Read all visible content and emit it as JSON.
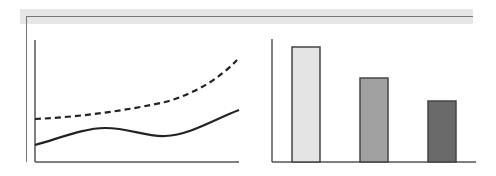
{
  "panel": {
    "frame_color": "#777777",
    "header_bar_color": "#e6e6e6"
  },
  "chart_data": [
    {
      "type": "line",
      "title": "",
      "xlabel": "",
      "ylabel": "",
      "grid": false,
      "legend": null,
      "x": [
        0,
        1,
        2,
        3,
        4,
        5,
        6
      ],
      "series": [
        {
          "name": "upper (dashed)",
          "style": "dashed",
          "color": "#222222",
          "values": [
            43,
            46,
            49,
            53,
            60,
            71,
            102
          ]
        },
        {
          "name": "lower (solid)",
          "style": "solid",
          "color": "#222222",
          "values": [
            17,
            26,
            34,
            30,
            26,
            35,
            52
          ]
        }
      ],
      "ylim": [
        0,
        120
      ]
    },
    {
      "type": "bar",
      "title": "",
      "xlabel": "",
      "ylabel": "",
      "grid": false,
      "legend": null,
      "categories": [
        "A",
        "B",
        "C"
      ],
      "values": [
        115,
        84,
        61
      ],
      "colors": [
        "#e4e4e4",
        "#a0a0a0",
        "#6a6a6a"
      ],
      "ylim": [
        0,
        123
      ]
    }
  ]
}
